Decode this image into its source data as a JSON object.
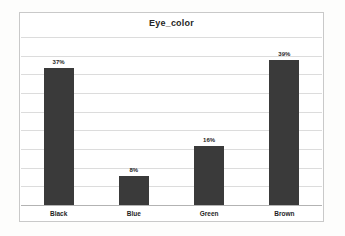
{
  "chart_data": {
    "type": "bar",
    "title": "Eye_color",
    "categories": [
      "Black",
      "Blue",
      "Green",
      "Brown"
    ],
    "values": [
      37,
      8,
      16,
      39
    ],
    "value_labels": [
      "37%",
      "8%",
      "16%",
      "39%"
    ],
    "xlabel": "",
    "ylabel": "",
    "ylim": [
      0,
      45
    ],
    "gridline_step": 5,
    "grid": true,
    "legend_position": "none",
    "colors": {
      "bar": "#3a3a3a",
      "gridline": "#dcdcdc",
      "axis_line": "#b3b3b3",
      "frame_border": "#c9c9c9",
      "plot_background": "#ffffff",
      "title_text": "#262626",
      "label_text": "#1f1f1f"
    }
  }
}
